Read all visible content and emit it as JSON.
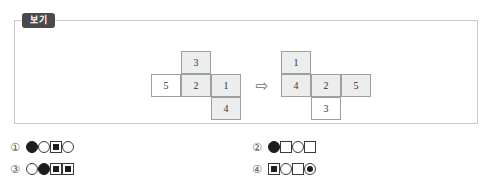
{
  "clipped_top_text": "",
  "panel": {
    "badge_label": "보기",
    "arrow_icon": "⇨"
  },
  "figures": {
    "left_net": {
      "name": "left-cube-net",
      "cells": [
        {
          "value": "3",
          "pos": "l-c3",
          "shaded": true
        },
        {
          "value": "5",
          "pos": "l-c5",
          "shaded": false
        },
        {
          "value": "2",
          "pos": "l-c2",
          "shaded": true
        },
        {
          "value": "1",
          "pos": "l-c1",
          "shaded": true
        },
        {
          "value": "4",
          "pos": "l-c4",
          "shaded": true
        }
      ]
    },
    "right_net": {
      "name": "right-cube-net",
      "cells": [
        {
          "value": "1",
          "pos": "r-c1",
          "shaded": true
        },
        {
          "value": "4",
          "pos": "r-c4",
          "shaded": true
        },
        {
          "value": "2",
          "pos": "r-c2",
          "shaded": true
        },
        {
          "value": "5",
          "pos": "r-c5",
          "shaded": true
        },
        {
          "value": "3",
          "pos": "r-c3",
          "shaded": false
        }
      ]
    }
  },
  "options": [
    {
      "number": "①",
      "glyphs": [
        "circle-filled",
        "circle-open",
        "square-in-square",
        "circle-open"
      ]
    },
    {
      "number": "②",
      "glyphs": [
        "circle-filled",
        "square-open",
        "circle-open",
        "square-open"
      ]
    },
    {
      "number": "③",
      "glyphs": [
        "circle-open",
        "circle-filled",
        "square-in-square",
        "square-in-square"
      ]
    },
    {
      "number": "④",
      "glyphs": [
        "square-in-square",
        "circle-open",
        "square-open",
        "circle-in-circle"
      ]
    }
  ],
  "colors": {
    "panel_border": "#c9cbcd",
    "badge_bg": "#4a4a4a",
    "cell_border": "#9e9e9e",
    "cell_shade": "#eceded",
    "glyph_ink": "#1d1d1d"
  }
}
